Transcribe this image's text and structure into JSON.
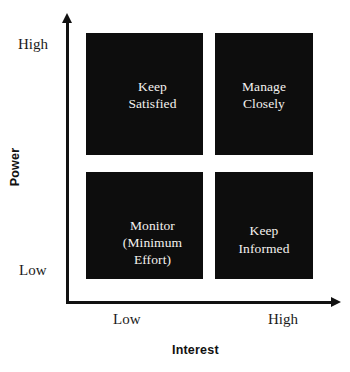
{
  "chart_data": {
    "type": "table",
    "xlabel": "Interest",
    "ylabel": "Power",
    "x_ticks": [
      "Low",
      "High"
    ],
    "y_ticks": [
      "Low",
      "High"
    ],
    "grid": false,
    "legend": "none",
    "cell_fill_color": "#0d0d0d",
    "cell_text_color": "#f4f2ef",
    "axis_color": "#111111",
    "background_color": "#ffffff",
    "quadrants": [
      {
        "id": "keep-satisfied",
        "power": "High",
        "interest": "Low",
        "position": "top-left",
        "lines": [
          "Keep",
          "Satisfied"
        ],
        "text": "Keep Satisfied"
      },
      {
        "id": "manage-closely",
        "power": "High",
        "interest": "High",
        "position": "top-right",
        "lines": [
          "Manage",
          "Closely"
        ],
        "text": "Manage Closely"
      },
      {
        "id": "monitor",
        "power": "Low",
        "interest": "Low",
        "position": "bottom-left",
        "lines": [
          "Monitor",
          "(Minimum",
          "Effort)"
        ],
        "text": "Monitor (Minimum Effort)"
      },
      {
        "id": "keep-informed",
        "power": "Low",
        "interest": "High",
        "position": "bottom-right",
        "lines": [
          "Keep",
          "Informed"
        ],
        "text": "Keep Informed"
      }
    ]
  },
  "axes": {
    "y": {
      "title": "Power",
      "tick_high": "High",
      "tick_low": "Low"
    },
    "x": {
      "title": "Interest",
      "tick_low": "Low",
      "tick_high": "High"
    }
  },
  "quadrant_text": {
    "keep_satisfied": {
      "line1": "Keep",
      "line2": "Satisfied"
    },
    "manage_closely": {
      "line1": "Manage",
      "line2": "Closely"
    },
    "monitor": {
      "line1": "Monitor",
      "line2": "(Minimum",
      "line3": "Effort)"
    },
    "keep_informed": {
      "line1": "Keep",
      "line2": "Informed"
    }
  }
}
